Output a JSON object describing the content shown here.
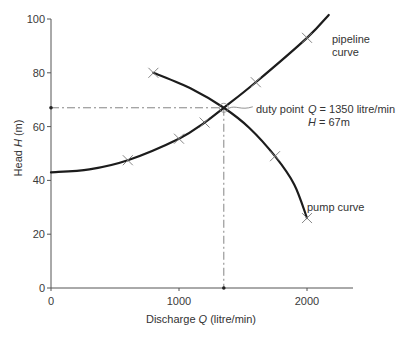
{
  "chart_data": {
    "type": "line",
    "title": "",
    "xlabel": "Discharge Q (litre/min)",
    "ylabel": "Head H (m)",
    "xlim": [
      0,
      2360
    ],
    "ylim": [
      0,
      100
    ],
    "xticks": [
      0,
      1000,
      2000
    ],
    "yticks": [
      0,
      20,
      40,
      60,
      80,
      100
    ],
    "grid": false,
    "legend": null,
    "series": [
      {
        "name": "pipeline curve",
        "points": [
          [
            0,
            43
          ],
          [
            300,
            44.1
          ],
          [
            600,
            47.5
          ],
          [
            1000,
            55.5
          ],
          [
            1200,
            61.5
          ],
          [
            1350,
            67
          ],
          [
            1600,
            76.5
          ],
          [
            2000,
            93
          ],
          [
            2170,
            101.5
          ]
        ],
        "markers": [
          [
            600,
            47.5
          ],
          [
            1000,
            55.5
          ],
          [
            1200,
            61.5
          ],
          [
            1600,
            76.5
          ],
          [
            2000,
            93
          ]
        ]
      },
      {
        "name": "pump curve",
        "points": [
          [
            800,
            80
          ],
          [
            1100,
            74
          ],
          [
            1350,
            67
          ],
          [
            1550,
            59.5
          ],
          [
            1750,
            49
          ],
          [
            1900,
            38.5
          ],
          [
            2000,
            26
          ]
        ],
        "markers": [
          [
            800,
            80
          ],
          [
            1750,
            49
          ],
          [
            2000,
            26
          ]
        ]
      }
    ],
    "duty_point": {
      "Q": 1350,
      "H": 67,
      "unit_Q": "litre/min",
      "unit_H": "m"
    },
    "annotations": [
      "pipeline curve",
      "pump curve",
      "duty point",
      "Q = 1350 litre/min",
      "H = 67m"
    ]
  },
  "labels": {
    "xlabel": {
      "prefix": "Discharge ",
      "var": "Q",
      "suffix": " (litre/min)"
    },
    "ylabel": {
      "prefix": "Head ",
      "var": "H",
      "suffix": " (m)"
    },
    "pipeline": {
      "line1": "pipeline",
      "line2": "curve"
    },
    "pump": "pump curve",
    "duty": "duty point",
    "duty_q": {
      "var": "Q",
      "text": " = 1350 litre/min"
    },
    "duty_h": {
      "var": "H",
      "text": " = 67m"
    }
  }
}
